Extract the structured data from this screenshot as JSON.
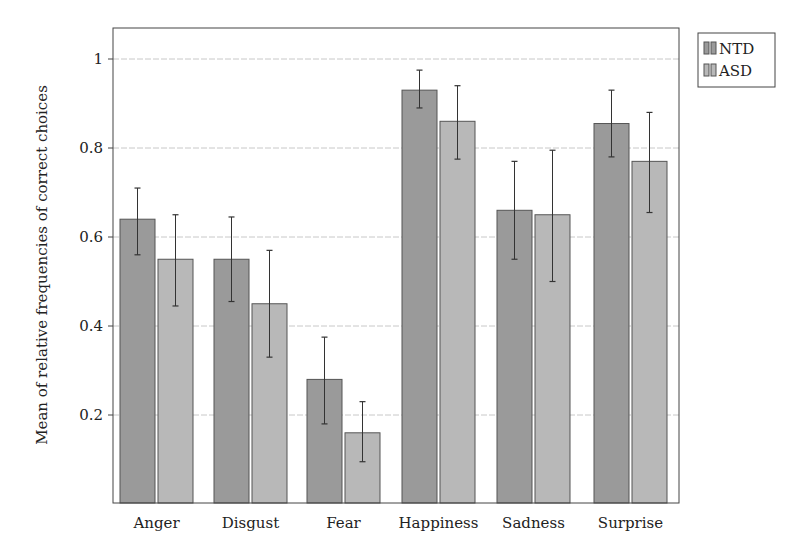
{
  "chart_data": {
    "type": "bar",
    "title": "",
    "xlabel": "",
    "ylabel": "Mean of relative frequencies of correct choices",
    "categories": [
      "Anger",
      "Disgust",
      "Fear",
      "Happiness",
      "Sadness",
      "Surprise"
    ],
    "series": [
      {
        "name": "NTD",
        "color": "#9a9a9a",
        "values": [
          0.64,
          0.55,
          0.28,
          0.93,
          0.66,
          0.855
        ],
        "error_low": [
          0.56,
          0.455,
          0.18,
          0.89,
          0.55,
          0.78
        ],
        "error_high": [
          0.71,
          0.645,
          0.375,
          0.975,
          0.77,
          0.93
        ]
      },
      {
        "name": "ASD",
        "color": "#b8b8b8",
        "values": [
          0.55,
          0.45,
          0.16,
          0.86,
          0.65,
          0.77
        ],
        "error_low": [
          0.445,
          0.33,
          0.095,
          0.775,
          0.5,
          0.655
        ],
        "error_high": [
          0.65,
          0.57,
          0.23,
          0.94,
          0.795,
          0.88
        ]
      }
    ],
    "yticks": [
      0.2,
      0.4,
      0.6,
      0.8,
      1
    ],
    "ytick_labels": [
      "0.2",
      "0.4",
      "0.6",
      "0.8",
      "1"
    ],
    "ylim": [
      0.01,
      1.07
    ],
    "grid": "horizontal",
    "legend": {
      "position": "outside-right-top",
      "entries": [
        "NTD",
        "ASD"
      ]
    }
  }
}
